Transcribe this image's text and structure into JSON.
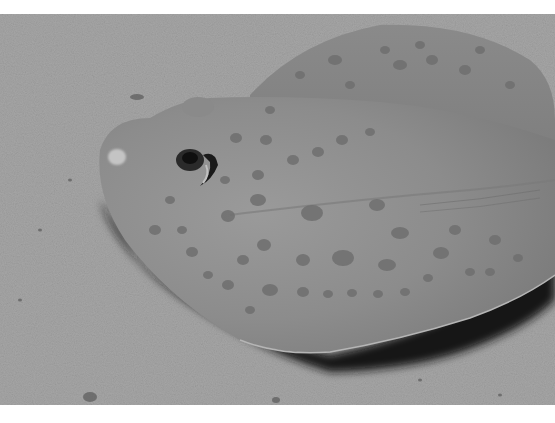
{
  "image": {
    "subject": "stingray resting on sandy seabed",
    "palette": {
      "border": "#ffffff",
      "sand": "#a6a6a6",
      "sand_dark": "#8f8f8f",
      "ray_body": "#8e8e8e",
      "ray_fin": "#858585",
      "ray_highlight": "#9c9c9c",
      "spots": "#6f6f6f",
      "shadow": "#141414",
      "eye": "#1a1a1a"
    }
  }
}
